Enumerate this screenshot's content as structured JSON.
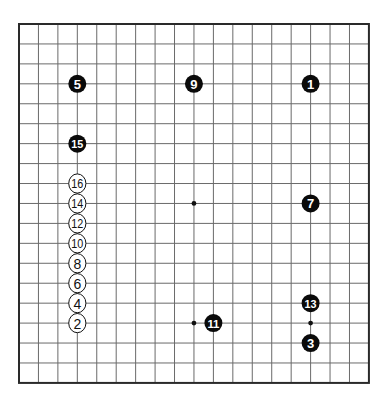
{
  "board": {
    "size": 19,
    "origin_x": 19,
    "origin_y": 24,
    "spacing_x": 19.44,
    "spacing_y": 19.94,
    "colors": {
      "background": "#ffffff",
      "grid": "#6a6a6a",
      "border": "#2a2a2a",
      "black_stone": "#0a0a0a",
      "white_stone": "#ffffff"
    },
    "star_points": [
      {
        "col": 3,
        "row": 3
      },
      {
        "col": 9,
        "row": 3
      },
      {
        "col": 15,
        "row": 3
      },
      {
        "col": 3,
        "row": 9
      },
      {
        "col": 9,
        "row": 9
      },
      {
        "col": 15,
        "row": 9
      },
      {
        "col": 3,
        "row": 15
      },
      {
        "col": 9,
        "row": 15
      },
      {
        "col": 15,
        "row": 15
      }
    ]
  },
  "moves": [
    {
      "number": "1",
      "color": "black",
      "col": 15,
      "row": 3
    },
    {
      "number": "2",
      "color": "white",
      "col": 3,
      "row": 15
    },
    {
      "number": "3",
      "color": "black",
      "col": 15,
      "row": 16
    },
    {
      "number": "4",
      "color": "white",
      "col": 3,
      "row": 14
    },
    {
      "number": "5",
      "color": "black",
      "col": 3,
      "row": 3
    },
    {
      "number": "6",
      "color": "white",
      "col": 3,
      "row": 13
    },
    {
      "number": "7",
      "color": "black",
      "col": 15,
      "row": 9
    },
    {
      "number": "8",
      "color": "white",
      "col": 3,
      "row": 12
    },
    {
      "number": "9",
      "color": "black",
      "col": 9,
      "row": 3
    },
    {
      "number": "10",
      "color": "white",
      "col": 3,
      "row": 11
    },
    {
      "number": "11",
      "color": "black",
      "col": 10,
      "row": 15
    },
    {
      "number": "12",
      "color": "white",
      "col": 3,
      "row": 10
    },
    {
      "number": "13",
      "color": "black",
      "col": 15,
      "row": 14
    },
    {
      "number": "14",
      "color": "white",
      "col": 3,
      "row": 9
    },
    {
      "number": "15",
      "color": "black",
      "col": 3,
      "row": 6
    },
    {
      "number": "16",
      "color": "white",
      "col": 3,
      "row": 8
    }
  ]
}
